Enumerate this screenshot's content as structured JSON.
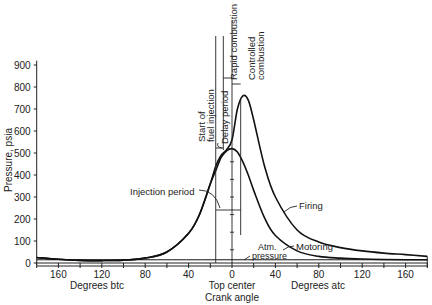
{
  "chart_data": {
    "type": "line",
    "title": "",
    "xlabel": "Crank angle",
    "ylabel": "Pressure, psia",
    "xlim": [
      -180,
      180
    ],
    "ylim": [
      0,
      900
    ],
    "x_ticks": [
      -160,
      -120,
      -80,
      -40,
      0,
      40,
      80,
      120,
      160
    ],
    "x_tick_labels": [
      "160",
      "120",
      "80",
      "40",
      "0",
      "40",
      "80",
      "120",
      "160"
    ],
    "y_ticks": [
      0,
      100,
      200,
      300,
      400,
      500,
      600,
      700,
      800,
      900
    ],
    "y_tick_labels": [
      "0",
      "100",
      "200",
      "300",
      "400",
      "500",
      "600",
      "700",
      "800",
      "900"
    ],
    "x_sublabels": {
      "left": "Degrees btc",
      "center": "Top center",
      "center2": "Crank angle",
      "right": "Degrees atc"
    },
    "grid": false,
    "series": [
      {
        "name": "Firing",
        "x": [
          -180,
          -160,
          -140,
          -120,
          -100,
          -80,
          -60,
          -40,
          -30,
          -20,
          -15,
          -10,
          -5,
          0,
          5,
          10,
          15,
          20,
          30,
          40,
          60,
          80,
          100,
          120,
          140,
          160,
          180
        ],
        "y": [
          25,
          17,
          12,
          11,
          13,
          22,
          50,
          135,
          220,
          360,
          440,
          490,
          515,
          560,
          700,
          760,
          740,
          650,
          440,
          300,
          150,
          95,
          70,
          55,
          45,
          38,
          30
        ]
      },
      {
        "name": "Motoring",
        "x": [
          -180,
          -160,
          -140,
          -120,
          -100,
          -80,
          -60,
          -40,
          -30,
          -20,
          -15,
          -10,
          -5,
          0,
          5,
          10,
          15,
          20,
          30,
          40,
          60,
          80,
          100,
          120,
          140,
          160,
          180
        ],
        "y": [
          25,
          17,
          12,
          11,
          13,
          22,
          50,
          135,
          220,
          360,
          420,
          480,
          510,
          520,
          505,
          460,
          400,
          330,
          205,
          125,
          55,
          30,
          22,
          18,
          16,
          15,
          15
        ]
      },
      {
        "name": "Atm. pressure",
        "x": [
          -180,
          180
        ],
        "y": [
          14.7,
          14.7
        ]
      }
    ],
    "annotations": [
      {
        "text": "Start of fuel injection",
        "x": -15
      },
      {
        "text": "Delay period",
        "x_range": [
          -15,
          -8
        ]
      },
      {
        "text": "Rapid combustion",
        "x_range": [
          -8,
          0
        ]
      },
      {
        "text": "Controlled combustion",
        "x_range": [
          0,
          8
        ]
      },
      {
        "text": "Injection period",
        "x_range": [
          -15,
          8
        ]
      },
      {
        "text": "Firing",
        "x": 35
      },
      {
        "text": "Motoring",
        "x": 50
      },
      {
        "text": "Atm. pressure",
        "x": 12
      }
    ]
  },
  "labels": {
    "ylabel": "Pressure, psia",
    "deg_btc": "Degrees btc",
    "deg_atc": "Degrees atc",
    "top_center": "Top center",
    "crank_angle": "Crank angle",
    "start1": "Start of",
    "start2": "fuel injection",
    "delay": "Delay period",
    "rapid": "Rapid combustion",
    "controlled1": "Controlled",
    "controlled2": "combustion",
    "injection": "Injection period",
    "firing": "Firing",
    "motoring": "Motoring",
    "atm1": "Atm.",
    "atm2": "pressure"
  }
}
